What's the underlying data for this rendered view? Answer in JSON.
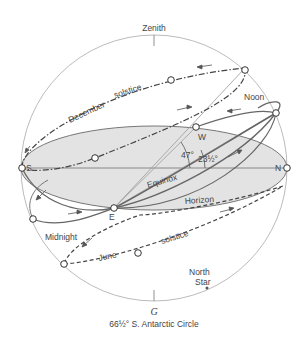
{
  "diagram": {
    "type": "celestial-sphere",
    "figure_letter": "G",
    "caption": "66½° S. Antarctic Circle",
    "labels": {
      "zenith": "Zenith",
      "noon": "Noon",
      "midnight": "Midnight",
      "south": "S",
      "north": "N",
      "east": "E",
      "west": "W",
      "equinox": "Equinox",
      "horizon": "Horizon",
      "december": "December",
      "december_solstice": "solstice",
      "june": "June",
      "june_solstice": "solstice",
      "north_star_line1": "North",
      "north_star_line2": "Star",
      "angle_47": "47°",
      "angle_23": "23½°"
    },
    "colors": {
      "horizon_fill": "#e3e3e3",
      "line": "#666666",
      "outline": "#999999",
      "text": "#444444"
    }
  }
}
